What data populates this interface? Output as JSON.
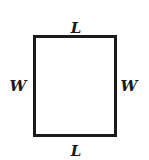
{
  "diagram": {
    "shape": "rectangle",
    "labels": {
      "top": "L",
      "bottom": "L",
      "left": "W",
      "right": "W"
    },
    "colors": {
      "stroke": "#1a1a1a",
      "fill": "#ffffff"
    }
  }
}
